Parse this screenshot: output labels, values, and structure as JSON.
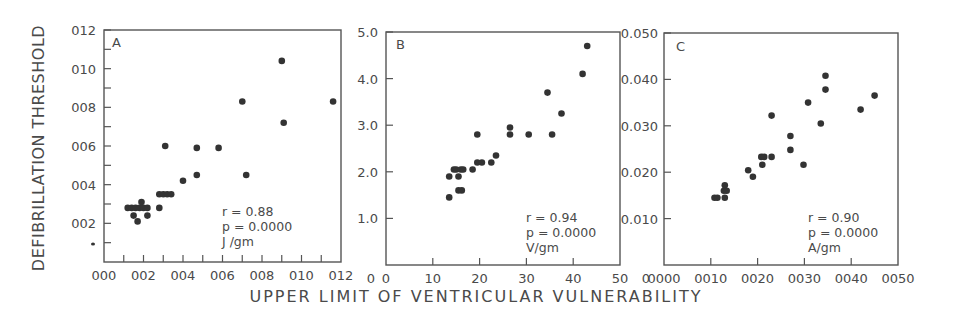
{
  "figure": {
    "y_title": "DEFIBRILLATION THRESHOLD",
    "x_title": "UPPER LIMIT OF VENTRICULAR VULNERABILITY",
    "ink_color": "#333333",
    "frame_color": "#555555"
  },
  "chart_data": [
    {
      "type": "scatter",
      "panel": "A",
      "title": "A",
      "xlabel": "UPPER LIMIT OF VENTRICULAR VULNERABILITY",
      "ylabel": "DEFIBRILLATION THRESHOLD",
      "units": "J /gm",
      "stats": {
        "r": "r = 0.88",
        "p": "p = 0.0000"
      },
      "xlim": [
        0,
        0.12
      ],
      "ylim": [
        0,
        0.12
      ],
      "xticks": [
        "0.00",
        "0.02",
        "0.04",
        "0.06",
        "0.08",
        "0.10",
        "0.12"
      ],
      "yticks": [
        "0.02",
        "0.04",
        "0.06",
        "0.08",
        "0.10",
        "0.12"
      ],
      "xtick_labels_display": [
        "000",
        "002",
        "004",
        "006",
        "008",
        "010",
        "012"
      ],
      "ytick_labels_display": [
        "002",
        "004",
        "006",
        "008",
        "010",
        "012"
      ],
      "minor_ticks": true,
      "grid": false,
      "points": [
        [
          0.012,
          0.028
        ],
        [
          0.014,
          0.028
        ],
        [
          0.016,
          0.028
        ],
        [
          0.018,
          0.028
        ],
        [
          0.02,
          0.028
        ],
        [
          0.022,
          0.028
        ],
        [
          0.015,
          0.024
        ],
        [
          0.017,
          0.021
        ],
        [
          0.019,
          0.031
        ],
        [
          0.022,
          0.024
        ],
        [
          0.028,
          0.028
        ],
        [
          0.028,
          0.035
        ],
        [
          0.03,
          0.035
        ],
        [
          0.032,
          0.035
        ],
        [
          0.034,
          0.035
        ],
        [
          0.031,
          0.06
        ],
        [
          0.04,
          0.042
        ],
        [
          0.047,
          0.059
        ],
        [
          0.047,
          0.045
        ],
        [
          0.058,
          0.059
        ],
        [
          0.07,
          0.083
        ],
        [
          0.072,
          0.045
        ],
        [
          0.09,
          0.104
        ],
        [
          0.091,
          0.072
        ],
        [
          0.116,
          0.083
        ]
      ]
    },
    {
      "type": "scatter",
      "panel": "B",
      "title": "B",
      "xlabel": "UPPER LIMIT OF VENTRICULAR VULNERABILITY",
      "ylabel": "DEFIBRILLATION THRESHOLD",
      "units": "V/gm",
      "stats": {
        "r": "r = 0.94",
        "p": "p = 0.0000"
      },
      "xlim": [
        0,
        50
      ],
      "ylim": [
        0,
        5.0
      ],
      "xticks": [
        "0",
        "10",
        "20",
        "30",
        "40",
        "50"
      ],
      "yticks": [
        "1.0",
        "2.0",
        "3.0",
        "4.0",
        "5.0"
      ],
      "xtick_labels_display": [
        "0",
        "10",
        "20",
        "30",
        "40",
        "50"
      ],
      "ytick_labels_display": [
        "1.0",
        "2.0",
        "3.0",
        "4.0",
        "5.0"
      ],
      "minor_ticks": false,
      "grid": false,
      "points": [
        [
          13.5,
          1.45
        ],
        [
          13.5,
          1.9
        ],
        [
          14.5,
          2.05
        ],
        [
          15.0,
          2.05
        ],
        [
          15.5,
          1.9
        ],
        [
          15.5,
          1.6
        ],
        [
          16.0,
          2.05
        ],
        [
          16.2,
          1.6
        ],
        [
          16.5,
          2.05
        ],
        [
          18.5,
          2.05
        ],
        [
          19.5,
          2.2
        ],
        [
          19.5,
          2.8
        ],
        [
          20.5,
          2.2
        ],
        [
          22.5,
          2.2
        ],
        [
          23.5,
          2.35
        ],
        [
          26.5,
          2.8
        ],
        [
          26.5,
          2.95
        ],
        [
          30.5,
          2.8
        ],
        [
          34.5,
          3.7
        ],
        [
          35.5,
          2.8
        ],
        [
          37.5,
          3.25
        ],
        [
          42.0,
          4.1
        ],
        [
          43.0,
          4.7
        ]
      ]
    },
    {
      "type": "scatter",
      "panel": "C",
      "title": "C",
      "xlabel": "UPPER LIMIT OF VENTRICULAR VULNERABILITY",
      "ylabel": "DEFIBRILLATION THRESHOLD",
      "units": "A/gm",
      "stats": {
        "r": "r = 0.90",
        "p": "p = 0.0000"
      },
      "xlim": [
        0,
        0.05
      ],
      "ylim": [
        0,
        0.05
      ],
      "xticks": [
        "0.000",
        "0.010",
        "0.020",
        "0.030",
        "0.040",
        "0.050"
      ],
      "yticks": [
        "0.010",
        "0.020",
        "0.030",
        "0.040",
        "0.050"
      ],
      "xtick_labels_display": [
        "0000",
        "0010",
        "0020",
        "0030",
        "0040",
        "0050"
      ],
      "ytick_labels_display": [
        "0.010",
        "0.020",
        "0.030",
        "0.040",
        "0.050"
      ],
      "minor_ticks": false,
      "grid": false,
      "points": [
        [
          0.0108,
          0.0145
        ],
        [
          0.0114,
          0.0145
        ],
        [
          0.013,
          0.0145
        ],
        [
          0.0128,
          0.016
        ],
        [
          0.0134,
          0.016
        ],
        [
          0.013,
          0.0172
        ],
        [
          0.018,
          0.0204
        ],
        [
          0.019,
          0.019
        ],
        [
          0.0208,
          0.0233
        ],
        [
          0.0214,
          0.0233
        ],
        [
          0.021,
          0.0216
        ],
        [
          0.023,
          0.0233
        ],
        [
          0.023,
          0.0322
        ],
        [
          0.027,
          0.0278
        ],
        [
          0.027,
          0.0248
        ],
        [
          0.0298,
          0.0216
        ],
        [
          0.0308,
          0.035
        ],
        [
          0.0335,
          0.0305
        ],
        [
          0.0345,
          0.0378
        ],
        [
          0.0345,
          0.0408
        ],
        [
          0.042,
          0.0335
        ],
        [
          0.045,
          0.0365
        ]
      ]
    }
  ]
}
